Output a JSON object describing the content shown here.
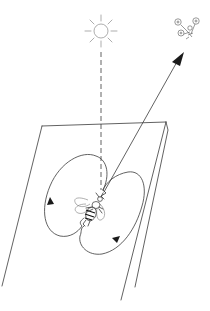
{
  "diagram": {
    "elements": {
      "sun": {
        "name": "sun",
        "cx": 101,
        "cy": 31,
        "r": 7,
        "color": "#8a8a8a"
      },
      "flowers": {
        "name": "flowers",
        "x": 184,
        "y": 24
      },
      "reference_line": {
        "name": "vertical reference (dashed)",
        "from": [
          101,
          52
        ],
        "to": [
          101,
          190
        ]
      },
      "direction_arrow": {
        "name": "direction to food source",
        "from": [
          104,
          192
        ],
        "to": [
          182,
          52
        ]
      },
      "comb": {
        "name": "vertical honeycomb surface",
        "color": "#3a3a3a"
      },
      "bee": {
        "name": "dancing bee",
        "x": 92,
        "y": 205
      },
      "dance_path": {
        "name": "figure-eight return loops",
        "arrows": 2
      }
    },
    "labels": []
  }
}
